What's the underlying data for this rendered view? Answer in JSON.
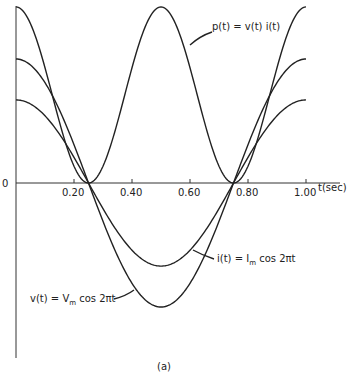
{
  "chart_data": {
    "type": "line",
    "title": "",
    "caption": "(a)",
    "xlabel": "t(sec)",
    "ylabel": "",
    "origin_label": "0",
    "xlim": [
      0,
      1.0
    ],
    "xticks": [
      0.2,
      0.4,
      0.6,
      0.8,
      1.0
    ],
    "xtick_labels": [
      "0.20",
      "0.40",
      "0.60",
      "0.80",
      "1.00"
    ],
    "grid": false,
    "legend": "inline annotations",
    "series": [
      {
        "name": "p(t) = v(t) i(t)",
        "formula": "Vm*Im*cos^2(2*pi*t)",
        "amplitude_rel": 1.42,
        "x": [
          0,
          0.125,
          0.25,
          0.375,
          0.5,
          0.625,
          0.75,
          0.875,
          1.0
        ],
        "values": [
          1.42,
          0.71,
          0,
          0.71,
          1.42,
          0.71,
          0,
          0.71,
          1.42
        ]
      },
      {
        "name": "v(t) = Vm cos 2πt",
        "formula": "Vm*cos(2*pi*t)",
        "amplitude_rel": 1.0,
        "x": [
          0,
          0.125,
          0.25,
          0.375,
          0.5,
          0.625,
          0.75,
          0.875,
          1.0
        ],
        "values": [
          1.0,
          0.707,
          0,
          -0.707,
          -1.0,
          -0.707,
          0,
          0.707,
          1.0
        ]
      },
      {
        "name": "i(t) = Im cos 2πt",
        "formula": "Im*cos(2*pi*t)",
        "amplitude_rel": 0.67,
        "x": [
          0,
          0.125,
          0.25,
          0.375,
          0.5,
          0.625,
          0.75,
          0.875,
          1.0
        ],
        "values": [
          0.67,
          0.47,
          0,
          -0.47,
          -0.67,
          -0.47,
          0,
          0.47,
          0.67
        ]
      }
    ],
    "annotations": [
      {
        "text": "p(t) = v(t) i(t)",
        "points_to": "p(t) curve near t≈0.62"
      },
      {
        "text": "i(t) = Im cos 2πt",
        "points_to": "i(t) curve near t≈0.6"
      },
      {
        "text": "v(t) = Vm cos 2πt",
        "points_to": "v(t) curve near t≈0.39"
      }
    ]
  },
  "labels": {
    "origin": "0",
    "xaxis": "t(sec)",
    "caption": "(a)",
    "p_label": "p(t) = v(t) i(t)",
    "i_label_pre": "i(t) = I",
    "i_label_sub": "m",
    "i_label_post": " cos 2πt",
    "v_label_pre": "v(t) = V",
    "v_label_sub": "m",
    "v_label_post": " cos 2πt"
  }
}
